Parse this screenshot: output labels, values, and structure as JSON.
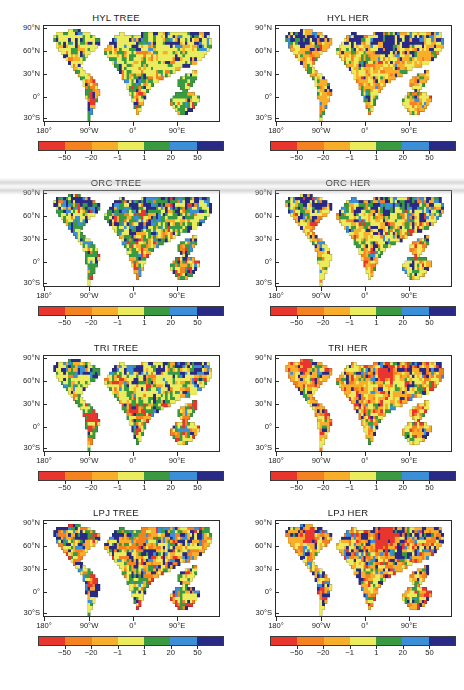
{
  "figure": {
    "rows": 4,
    "cols": 2,
    "projection": "equirectangular",
    "lon_range": [
      -180,
      180
    ],
    "lat_range": [
      -60,
      90
    ]
  },
  "axes": {
    "y_ticks": [
      "90°N",
      "60°N",
      "30°N",
      "0°",
      "30°S"
    ],
    "y_values": [
      90,
      60,
      30,
      0,
      -30
    ],
    "x_ticks": [
      "180°",
      "90°W",
      "0°",
      "90°E"
    ],
    "x_values": [
      -180,
      -90,
      0,
      90
    ]
  },
  "colorbar": {
    "tick_labels": [
      "−50",
      "−20",
      "−1",
      "1",
      "20",
      "50"
    ],
    "tick_values": [
      -50,
      -20,
      -1,
      1,
      20,
      50
    ],
    "colors": [
      "#e8352e",
      "#f58220",
      "#f9ae2b",
      "#ebeb5e",
      "#3a9a41",
      "#3a8fd8",
      "#282a86"
    ],
    "segment_labels": [
      "< -50",
      "-50 to -20",
      "-20 to -1",
      "-1 to 1",
      "1 to 20",
      "20 to 50",
      "> 50"
    ]
  },
  "panels": [
    {
      "id": "hyl-tree",
      "title": "HYL TREE",
      "model": "HYL",
      "pft": "TREE",
      "row": 0,
      "col": 0
    },
    {
      "id": "hyl-her",
      "title": "HYL HER",
      "model": "HYL",
      "pft": "HER",
      "row": 0,
      "col": 1
    },
    {
      "id": "orc-tree",
      "title": "ORC TREE",
      "model": "ORC",
      "pft": "TREE",
      "row": 1,
      "col": 0
    },
    {
      "id": "orc-her",
      "title": "ORC HER",
      "model": "ORC",
      "pft": "HER",
      "row": 1,
      "col": 1
    },
    {
      "id": "tri-tree",
      "title": "TRI TREE",
      "model": "TRI",
      "pft": "TREE",
      "row": 2,
      "col": 0
    },
    {
      "id": "tri-her",
      "title": "TRI HER",
      "model": "TRI",
      "pft": "HER",
      "row": 2,
      "col": 1
    },
    {
      "id": "lpj-tree",
      "title": "LPJ TREE",
      "model": "LPJ",
      "pft": "TREE",
      "row": 3,
      "col": 0
    },
    {
      "id": "lpj-her",
      "title": "LPJ HER",
      "model": "LPJ",
      "pft": "HER",
      "row": 3,
      "col": 1
    }
  ],
  "chart_data": {
    "type": "heatmap",
    "title": "",
    "xlabel": "",
    "ylabel": "",
    "xlim": [
      -180,
      180
    ],
    "ylim": [
      -60,
      90
    ],
    "grid": false,
    "legend": "discrete colorbar below each map",
    "colorbar_levels": [
      -50,
      -20,
      -1,
      1,
      20,
      50
    ],
    "colorbar_colors": [
      "#e8352e",
      "#f58220",
      "#f9ae2b",
      "#ebeb5e",
      "#3a9a41",
      "#3a8fd8",
      "#282a86"
    ],
    "series": [
      {
        "name": "HYL TREE",
        "dominant_classes": [
          "-1 to 1",
          "1 to 20"
        ],
        "notes": "Most land in the -1 to 1 (pale yellow) class; broad 1-20 green belts across tropical South America, central Africa, SE Asia; localized -50 to -20 red/orange hotspot over the Amazon; narrow >50 navy fringe along coasts and Himalaya."
      },
      {
        "name": "HYL HER",
        "dominant_classes": [
          "-1 to 1",
          "-20 to -1",
          "> 50"
        ],
        "notes": "Widespread -20 to -1 orange over North America, Sahel, India, Australia and South America; strong >50 navy band across the Arctic coast of Eurasia and Canada plus Tibetan Plateau; pale yellow interiors."
      },
      {
        "name": "ORC TREE",
        "dominant_classes": [
          "1 to 20",
          "-1 to 1",
          "> 50"
        ],
        "notes": "Highly speckled mosaic; large navy >50 area over northern Canada and Siberia; extensive green 1-20 across South America, Africa and boreal forest; scattered red-orange pixels in tropical South America."
      },
      {
        "name": "ORC HER",
        "dominant_classes": [
          "-1 to 1",
          "> 50",
          "20 to 50"
        ],
        "notes": "Pale yellow dominant over Sahara, Australia and central Asia; dense navy and blue speckle over boreal North America and Siberia; orange fragments along Sahel and western North America."
      },
      {
        "name": "TRI TREE",
        "dominant_classes": [
          "-1 to 1",
          "1 to 20",
          "> 50"
        ],
        "notes": "Pale yellow over deserts and mid-latitudes; blue/navy block over north-central Canada and central-eastern Siberia; deep red -50 to -20 cluster over the Amazon basin and a smaller one over equatorial East Africa."
      },
      {
        "name": "TRI HER",
        "dominant_classes": [
          "-20 to -1",
          "-1 to 1",
          "> 50"
        ],
        "notes": "Broad orange -20 to -1 over Eurasian steppe, Sahel, India and western North America; red -50 to -20 patches over central Asia and Canadian Arctic; navy band along the Arctic coast."
      },
      {
        "name": "LPJ TREE",
        "dominant_classes": [
          "-1 to 1",
          "> 50",
          "-20 to -1"
        ],
        "notes": "Strong mixed signal: navy >50 ring around the Arctic and along coasts, orange/red -50 to -1 belt across central Eurasia and western North America, pale yellow over Sahara, Australia and central Africa."
      },
      {
        "name": "LPJ HER",
        "dominant_classes": [
          "-20 to -1",
          "> 50",
          "-1 to 1"
        ],
        "notes": "Most heterogeneous panel: dense red/orange across the Eurasian mid-latitude belt and boreal Canada, interleaved with navy and blue; pale yellow preserved over Sahara, Arabia, Australia and the Amazon."
      }
    ]
  }
}
